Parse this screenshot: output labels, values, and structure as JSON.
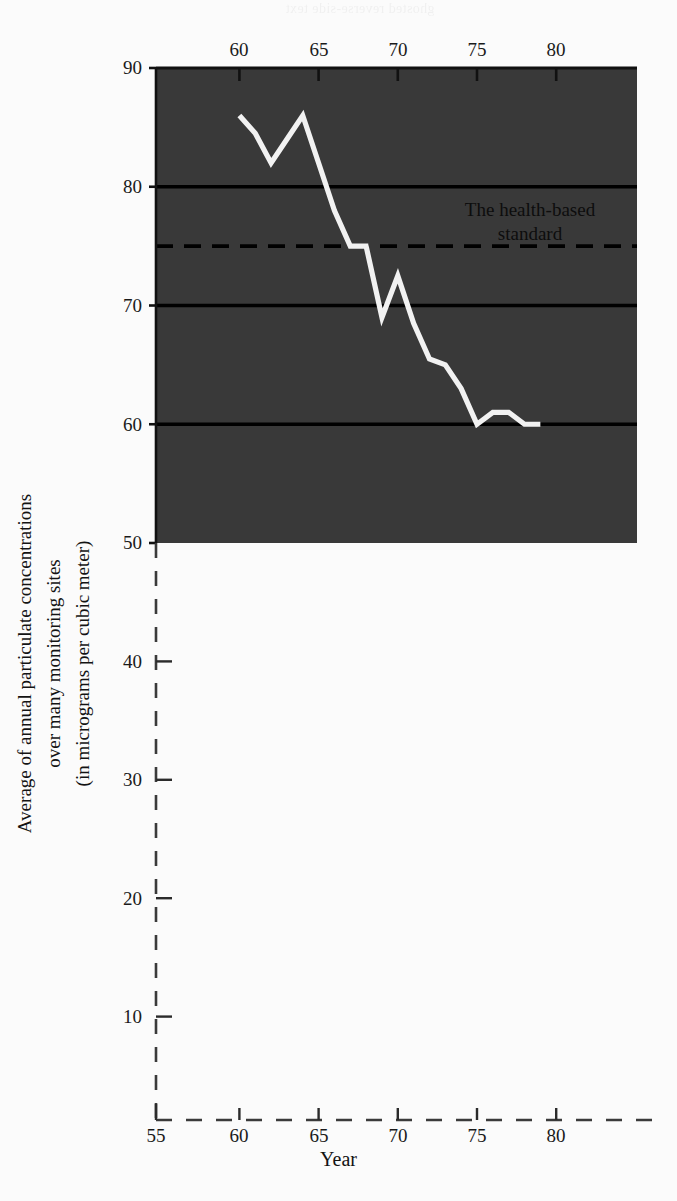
{
  "figure": {
    "bleed_through_text": "ghosted reverse-side text",
    "panel_color": "#393939",
    "line_color": "#f2f2f2",
    "gridline_color": "#000000",
    "axis_color": "#1a1a1a"
  },
  "annotation": {
    "line1": "The health-based",
    "line2": "standard"
  },
  "axis_titles": {
    "y_line1": "Average of annual particulate concentrations",
    "y_line2": "over many monitoring sites",
    "y_line3": "(in micrograms per cubic meter)",
    "x": "Year"
  },
  "y_ticks": [
    {
      "label": "90"
    },
    {
      "label": "80"
    },
    {
      "label": "70"
    },
    {
      "label": "60"
    },
    {
      "label": "50"
    },
    {
      "label": "40"
    },
    {
      "label": "30"
    },
    {
      "label": "20"
    },
    {
      "label": "10"
    }
  ],
  "x_ticks": [
    {
      "label": "55"
    },
    {
      "label": "60"
    },
    {
      "label": "65"
    },
    {
      "label": "70"
    },
    {
      "label": "75"
    },
    {
      "label": "80"
    }
  ],
  "chart_data": {
    "type": "line",
    "title": "",
    "xlabel": "Year",
    "ylabel": "Average of annual particulate concentrations over many monitoring sites (in micrograms per cubic meter)",
    "xlim": [
      55,
      84
    ],
    "ylim": [
      0,
      90
    ],
    "panel_xlim": [
      55.2,
      84
    ],
    "panel_ylim": [
      50,
      90
    ],
    "grid": true,
    "gridlines_y": [
      80,
      70,
      60
    ],
    "legend": "none",
    "x_tick_values": [
      55,
      60,
      65,
      70,
      75,
      80
    ],
    "y_tick_values": [
      10,
      20,
      30,
      40,
      50,
      60,
      70,
      80,
      90
    ],
    "reference_line": {
      "label": "The health-based standard",
      "value": 75,
      "style": "dashed"
    },
    "series": [
      {
        "name": "Average annual particulate concentration",
        "x": [
          60,
          61,
          62,
          63,
          64,
          65,
          66,
          67,
          68,
          69,
          70,
          71,
          72,
          73,
          74,
          75,
          76,
          77,
          78,
          79
        ],
        "values": [
          86,
          84.5,
          82,
          84,
          86,
          82,
          78,
          75,
          75,
          69,
          72.5,
          68.5,
          65.5,
          65,
          63,
          60,
          61,
          61,
          60,
          60
        ]
      }
    ]
  }
}
